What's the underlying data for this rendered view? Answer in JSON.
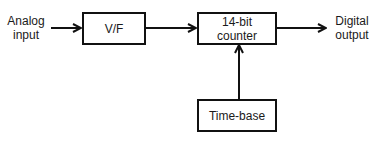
{
  "diagram": {
    "type": "block-diagram",
    "input_label": {
      "line1": "Analog",
      "line2": "input"
    },
    "output_label": {
      "line1": "Digital",
      "line2": "output"
    },
    "blocks": [
      {
        "id": "vf",
        "label": "V/F"
      },
      {
        "id": "counter",
        "line1": "14-bit",
        "line2": "counter"
      },
      {
        "id": "timebase",
        "label": "Time-base"
      }
    ],
    "connections": [
      {
        "from": "analog-input",
        "to": "vf"
      },
      {
        "from": "vf",
        "to": "counter"
      },
      {
        "from": "counter",
        "to": "digital-output"
      },
      {
        "from": "timebase",
        "to": "counter"
      }
    ],
    "colors": {
      "line": "#111111",
      "background": "#ffffff"
    }
  }
}
